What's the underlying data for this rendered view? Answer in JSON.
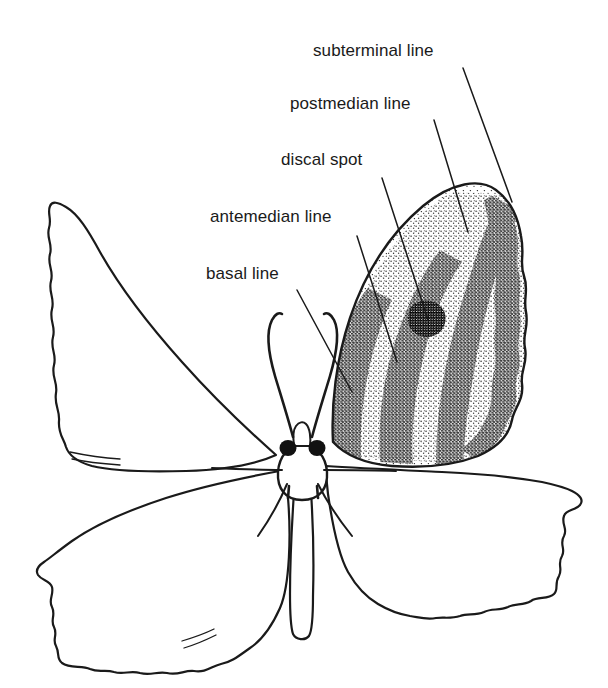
{
  "figure": {
    "background_color": "#ffffff",
    "ink_color": "#1a1a1a",
    "width": 608,
    "height": 688
  },
  "labels": [
    {
      "id": "subterminal",
      "text": "subterminal line",
      "x": 313,
      "y": 42,
      "leader": {
        "from_x": 463,
        "from_y": 68,
        "to_x": 512,
        "to_y": 202
      }
    },
    {
      "id": "postmedian",
      "text": "postmedian line",
      "x": 290,
      "y": 95,
      "leader": {
        "from_x": 434,
        "from_y": 120,
        "to_x": 468,
        "to_y": 232
      }
    },
    {
      "id": "discal",
      "text": "discal spot",
      "x": 281,
      "y": 151,
      "leader": {
        "from_x": 382,
        "from_y": 178,
        "to_x": 428,
        "to_y": 320
      }
    },
    {
      "id": "antemedian",
      "text": "antemedian line",
      "x": 210,
      "y": 208,
      "leader": {
        "from_x": 357,
        "from_y": 236,
        "to_x": 397,
        "to_y": 362
      }
    },
    {
      "id": "basal",
      "text": "basal line",
      "x": 206,
      "y": 265,
      "leader": {
        "from_x": 297,
        "from_y": 290,
        "to_x": 352,
        "to_y": 392
      }
    }
  ],
  "anatomy": {
    "parts": [
      "left-forewing",
      "right-forewing",
      "left-hindwing",
      "right-hindwing",
      "thorax",
      "abdomen",
      "head",
      "eyes",
      "antennae"
    ],
    "patterned_wing": "right-forewing",
    "pattern_bands": [
      "basal line",
      "antemedian line",
      "postmedian line",
      "subterminal line"
    ],
    "pattern_marks": [
      "discal spot"
    ],
    "shading_style": "stipple"
  },
  "style": {
    "line_width": 2.2,
    "label_font_size": 17,
    "stipple_density": "graded"
  }
}
